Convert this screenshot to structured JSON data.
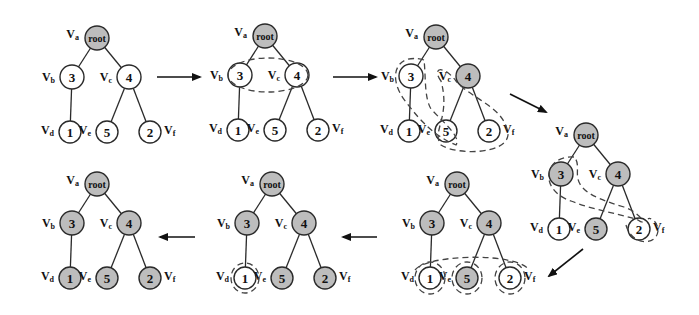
{
  "figure": {
    "node_labels": {
      "root": "root",
      "b": "3",
      "c": "4",
      "d": "1",
      "e": "5",
      "f": "2"
    },
    "vertex_names": {
      "a": {
        "main": "V",
        "sub": "a"
      },
      "b": {
        "main": "V",
        "sub": "b"
      },
      "c": {
        "main": "V",
        "sub": "c"
      },
      "d": {
        "main": "V",
        "sub": "d"
      },
      "e": {
        "main": "V",
        "sub": "e"
      },
      "f": {
        "main": "V",
        "sub": "f"
      }
    },
    "colors": {
      "shaded_node": "#bdbdbd",
      "plain_node": "#ffffff",
      "stroke": "#2a2a2a"
    },
    "stages": [
      {
        "id": 1,
        "shaded": [
          "root"
        ],
        "groups": []
      },
      {
        "id": 2,
        "shaded": [
          "root"
        ],
        "groups": [
          "b+c"
        ]
      },
      {
        "id": 3,
        "shaded": [
          "root",
          "c"
        ],
        "groups": [
          "b+d",
          "e+f"
        ]
      },
      {
        "id": 4,
        "shaded": [
          "root",
          "b",
          "c",
          "e"
        ],
        "groups": [
          "b+f",
          "f"
        ]
      },
      {
        "id": 5,
        "shaded": [
          "root",
          "b",
          "c",
          "e"
        ],
        "groups": [
          "d+e+f",
          "d",
          "e",
          "f"
        ]
      },
      {
        "id": 6,
        "shaded": [
          "root",
          "b",
          "c",
          "e",
          "f"
        ],
        "groups": [
          "d"
        ]
      },
      {
        "id": 7,
        "shaded": [
          "root",
          "b",
          "c",
          "d",
          "e",
          "f"
        ],
        "groups": []
      }
    ],
    "flow": [
      "1 → 2",
      "2 → 3",
      "3 → 4",
      "4 → 5",
      "5 → 6",
      "6 → 7"
    ]
  }
}
